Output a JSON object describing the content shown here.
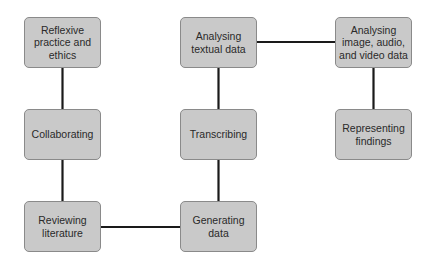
{
  "diagram": {
    "type": "flow",
    "colors": {
      "node_fill": "#c9c9c9",
      "node_border": "#8a8a8a",
      "edge": "#1a1a1a",
      "text": "#2a2a2a"
    },
    "nodes": [
      {
        "id": "reflexive",
        "label": "Reflexive practice and ethics"
      },
      {
        "id": "collaborating",
        "label": "Collaborating"
      },
      {
        "id": "reviewing",
        "label": "Reviewing literature"
      },
      {
        "id": "generating",
        "label": "Generating data"
      },
      {
        "id": "transcribing",
        "label": "Transcribing"
      },
      {
        "id": "analysing_text",
        "label": "Analysing textual data"
      },
      {
        "id": "analysing_media",
        "label": "Analysing image, audio, and video data"
      },
      {
        "id": "representing",
        "label": "Representing findings"
      }
    ],
    "edges": [
      [
        "reflexive",
        "collaborating"
      ],
      [
        "collaborating",
        "reviewing"
      ],
      [
        "reviewing",
        "generating"
      ],
      [
        "generating",
        "transcribing"
      ],
      [
        "transcribing",
        "analysing_text"
      ],
      [
        "analysing_text",
        "analysing_media"
      ],
      [
        "analysing_media",
        "representing"
      ]
    ]
  }
}
